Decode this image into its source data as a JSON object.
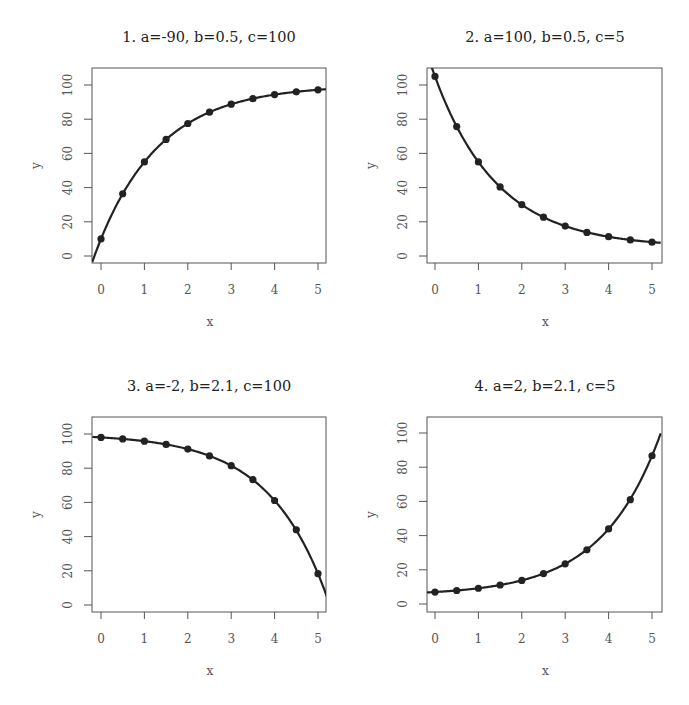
{
  "figure": {
    "width": 689,
    "height": 705,
    "layout": "2x2 grid"
  },
  "chart_data": [
    {
      "type": "line",
      "title": "1.  a=-90,  b=0.5,  c=100",
      "formula": "y = c + a * b^x",
      "params": {
        "a": -90,
        "b": 0.5,
        "c": 100
      },
      "xlabel": "x",
      "ylabel": "y",
      "xlim": [
        -0.2,
        5.2
      ],
      "ylim": [
        -4,
        110
      ],
      "xticks": [
        0,
        1,
        2,
        3,
        4,
        5
      ],
      "yticks": [
        0,
        20,
        40,
        60,
        80,
        100
      ],
      "grid": false,
      "legend": null,
      "points": {
        "x": [
          0,
          0.5,
          1,
          1.5,
          2,
          2.5,
          3,
          3.5,
          4,
          4.5,
          5
        ],
        "y": [
          10,
          36.4,
          55,
          68.2,
          77.5,
          84.1,
          88.8,
          92.0,
          94.4,
          96.0,
          97.2
        ]
      }
    },
    {
      "type": "line",
      "title": "2.  a=100,  b=0.5,  c=5",
      "formula": "y = c + a * b^x",
      "params": {
        "a": 100,
        "b": 0.5,
        "c": 5
      },
      "xlabel": "x",
      "ylabel": "y",
      "xlim": [
        -0.2,
        5.2
      ],
      "ylim": [
        -4,
        110
      ],
      "xticks": [
        0,
        1,
        2,
        3,
        4,
        5
      ],
      "yticks": [
        0,
        20,
        40,
        60,
        80,
        100
      ],
      "grid": false,
      "legend": null,
      "points": {
        "x": [
          0,
          0.5,
          1,
          1.5,
          2,
          2.5,
          3,
          3.5,
          4,
          4.5,
          5
        ],
        "y": [
          105,
          75.7,
          55,
          40.4,
          30,
          22.7,
          17.5,
          13.8,
          11.3,
          9.4,
          8.1
        ]
      }
    },
    {
      "type": "line",
      "title": "3.  a=-2,  b=2.1,  c=100",
      "formula": "y = c + a * b^x",
      "params": {
        "a": -2,
        "b": 2.1,
        "c": 100
      },
      "xlabel": "x",
      "ylabel": "y",
      "xlim": [
        -0.2,
        5.2
      ],
      "ylim": [
        -4,
        110
      ],
      "xticks": [
        0,
        1,
        2,
        3,
        4,
        5
      ],
      "yticks": [
        0,
        20,
        40,
        60,
        80,
        100
      ],
      "grid": false,
      "legend": null,
      "points": {
        "x": [
          0,
          0.5,
          1,
          1.5,
          2,
          2.5,
          3,
          3.5,
          4,
          4.5,
          5
        ],
        "y": [
          98,
          97.1,
          95.8,
          93.9,
          91.2,
          87.2,
          81.5,
          73.3,
          61.1,
          44.0,
          18.3
        ]
      }
    },
    {
      "type": "line",
      "title": "4.  a=2,  b=2.1,  c=5",
      "formula": "y = c + a * b^x",
      "params": {
        "a": 2,
        "b": 2.1,
        "c": 5
      },
      "xlabel": "x",
      "ylabel": "y",
      "xlim": [
        -0.2,
        5.2
      ],
      "ylim": [
        -4,
        110
      ],
      "xticks": [
        0,
        1,
        2,
        3,
        4,
        5
      ],
      "yticks": [
        0,
        20,
        40,
        60,
        80,
        100
      ],
      "grid": false,
      "legend": null,
      "points": {
        "x": [
          0,
          0.5,
          1,
          1.5,
          2,
          2.5,
          3,
          3.5,
          4,
          4.5,
          5
        ],
        "y": [
          7,
          7.9,
          9.2,
          11.1,
          13.8,
          17.8,
          23.5,
          31.7,
          43.9,
          61.0,
          86.7
        ]
      }
    }
  ],
  "panels": [
    {
      "box": [
        92,
        68,
        326,
        263
      ],
      "x0": 101,
      "x5": 318,
      "y0": 256,
      "y100": 85,
      "title_x": 209,
      "title_y": 42
    },
    {
      "box": [
        427,
        68,
        662,
        263
      ],
      "x0": 435,
      "x5": 652,
      "y0": 256,
      "y100": 85,
      "title_x": 545,
      "title_y": 42
    },
    {
      "box": [
        92,
        417,
        326,
        612
      ],
      "x0": 101,
      "x5": 318,
      "y0": 605,
      "y100": 434,
      "title_x": 209,
      "title_y": 391
    },
    {
      "box": [
        427,
        417,
        662,
        612
      ],
      "x0": 435,
      "x5": 652,
      "y0": 604,
      "y100": 433,
      "title_x": 545,
      "title_y": 391
    }
  ],
  "colors": {
    "curve": "#222222",
    "axes": "#555555",
    "background": "#ffffff"
  }
}
